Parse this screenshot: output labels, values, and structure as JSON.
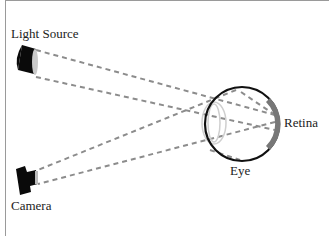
{
  "diagram": {
    "labels": {
      "light_source": "Light Source",
      "camera": "Camera",
      "retina": "Retina",
      "eye": "Eye"
    },
    "colors": {
      "ray": "#8c8c8c",
      "eye_outline": "#111111",
      "lens": "#c8c8c8",
      "retina": "#777777",
      "device": "#0a0a0a"
    }
  }
}
